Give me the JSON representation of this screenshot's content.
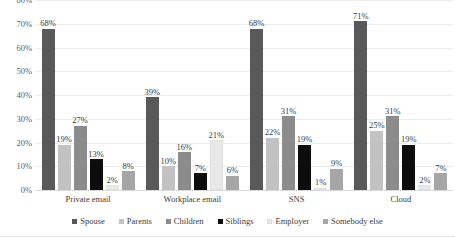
{
  "chart_data": {
    "type": "bar",
    "title": "",
    "subtitle": "",
    "xlabel": "",
    "ylabel": "",
    "categories": [
      "Private email",
      "Workplace email",
      "SNS",
      "Cloud"
    ],
    "series": [
      {
        "name": "Spouse",
        "color": "#595959",
        "values": [
          68,
          39,
          68,
          71
        ]
      },
      {
        "name": "Parents",
        "color": "#c3c3c3",
        "values": [
          19,
          10,
          22,
          25
        ]
      },
      {
        "name": "Children",
        "color": "#8c8c8c",
        "values": [
          27,
          16,
          31,
          31
        ]
      },
      {
        "name": "Siblings",
        "color": "#0d0d0d",
        "values": [
          13,
          7,
          19,
          19
        ]
      },
      {
        "name": "Employer",
        "color": "#e8e8e8",
        "values": [
          2,
          21,
          1,
          2
        ]
      },
      {
        "name": "Somebody else",
        "color": "#a6a6a6",
        "values": [
          8,
          6,
          9,
          7
        ]
      }
    ],
    "value_labels": [
      [
        "68%",
        "19%",
        "27%",
        "13%",
        "2%",
        "8%"
      ],
      [
        "39%",
        "10%",
        "16%",
        "7%",
        "21%",
        "6%"
      ],
      [
        "68%",
        "22%",
        "31%",
        "19%",
        "1%",
        "9%"
      ],
      [
        "71%",
        "25%",
        "31%",
        "19%",
        "2%",
        "7%"
      ]
    ],
    "ylim": [
      0,
      80
    ],
    "y_ticks": [
      0,
      10,
      20,
      30,
      40,
      50,
      60,
      70,
      80
    ],
    "y_tick_labels": [
      "0%",
      "10%",
      "20%",
      "30%",
      "40%",
      "50%",
      "60%",
      "70%",
      "80%"
    ],
    "grid": true,
    "grid_axis": "y",
    "legend_position": "bottom",
    "legend_entries": [
      "Spouse",
      "Parents",
      "Children",
      "Siblings",
      "Employer",
      "Somebody else"
    ],
    "background_color": "#ffffff",
    "gridline_color": "#ececec",
    "text_color": "#3d3d3d"
  }
}
